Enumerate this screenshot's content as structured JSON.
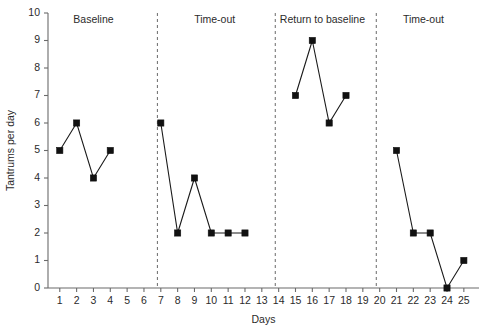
{
  "chart_data": {
    "type": "line",
    "title": "",
    "xlabel": "Days",
    "ylabel": "Tantrums per day",
    "xlim": [
      0.3,
      25.9
    ],
    "ylim": [
      0,
      10
    ],
    "grid": false,
    "legend": "none",
    "x_ticks": [
      1,
      2,
      3,
      4,
      5,
      6,
      7,
      8,
      9,
      10,
      11,
      12,
      13,
      14,
      15,
      16,
      17,
      18,
      19,
      20,
      21,
      22,
      23,
      24,
      25
    ],
    "y_ticks": [
      0,
      1,
      2,
      3,
      4,
      5,
      6,
      7,
      8,
      9,
      10
    ],
    "marker": "square",
    "series": [
      {
        "name": "Baseline",
        "x": [
          1,
          2,
          3,
          4
        ],
        "values": [
          5,
          6,
          4,
          5
        ]
      },
      {
        "name": "Time-out",
        "x": [
          7,
          8,
          9,
          10,
          11,
          12
        ],
        "values": [
          6,
          2,
          4,
          2,
          2,
          2
        ]
      },
      {
        "name": "Return to baseline",
        "x": [
          15,
          16,
          17,
          18
        ],
        "values": [
          7,
          9,
          6,
          7
        ]
      },
      {
        "name": "Time-out",
        "x": [
          21,
          22,
          23,
          24,
          25
        ],
        "values": [
          5,
          2,
          2,
          0,
          1
        ]
      }
    ],
    "phases": [
      {
        "label": "Baseline",
        "center_day": 3.0,
        "start_day": 0.3,
        "end_day": 6.8
      },
      {
        "label": "Time-out",
        "center_day": 10.2,
        "start_day": 6.8,
        "end_day": 13.8
      },
      {
        "label": "Return to baseline",
        "center_day": 16.6,
        "start_day": 13.8,
        "end_day": 19.8
      },
      {
        "label": "Time-out",
        "center_day": 22.6,
        "start_day": 19.8,
        "end_day": 25.9
      }
    ],
    "phase_dividers_at_day": [
      6.8,
      13.8,
      19.8
    ],
    "colors": {
      "line": "#1a1a1a",
      "marker": "#111111",
      "axis": "#6b6b6b",
      "divider": "#777777",
      "background": "#ffffff"
    }
  }
}
